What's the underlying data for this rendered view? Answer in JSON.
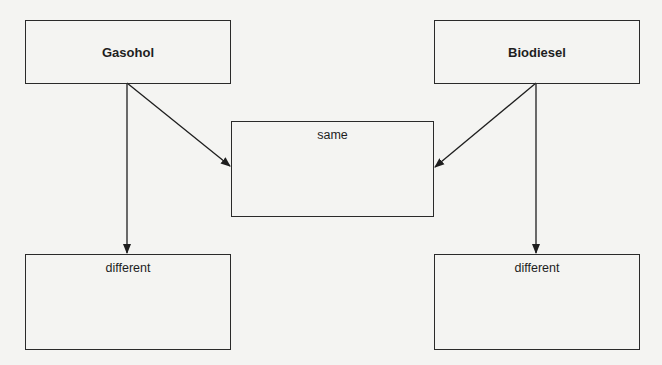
{
  "diagram": {
    "nodes": {
      "gasohol": {
        "label": "Gasohol"
      },
      "biodiesel": {
        "label": "Biodiesel"
      },
      "same": {
        "label": "same"
      },
      "different_left": {
        "label": "different"
      },
      "different_right": {
        "label": "different"
      }
    },
    "edges": [
      {
        "from": "gasohol",
        "to": "same"
      },
      {
        "from": "gasohol",
        "to": "different_left"
      },
      {
        "from": "biodiesel",
        "to": "same"
      },
      {
        "from": "biodiesel",
        "to": "different_right"
      }
    ]
  }
}
